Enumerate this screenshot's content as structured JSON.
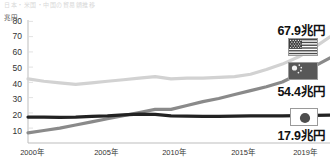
{
  "top_title": "日本・米国・中国の貿易額推移",
  "axis": {
    "unit": "兆円",
    "y_ticks": [
      "80",
      "70",
      "60",
      "50",
      "40",
      "30",
      "20",
      "10"
    ],
    "y_min": 0,
    "y_max": 80,
    "x_ticks": [
      "2000年",
      "2005年",
      "2010年",
      "2015年",
      "2019年"
    ]
  },
  "callouts": {
    "us": "67.9兆円",
    "china": "54.4兆円",
    "japan": "17.9兆円"
  },
  "flags": {
    "us": "us-flag-icon",
    "china": "china-flag-icon",
    "japan": "japan-flag-icon"
  },
  "colors": {
    "us_line": "#d2d2d2",
    "china_line": "#8a8a8a",
    "japan_line": "#222222",
    "axis": "#bdbdbd",
    "text": "#222222"
  },
  "chart_data": {
    "type": "line",
    "title": "日本・米国・中国の貿易額推移",
    "xlabel": "",
    "ylabel": "兆円",
    "ylim": [
      0,
      80
    ],
    "xlim": [
      2000,
      2019
    ],
    "grid": true,
    "legend_position": "right",
    "x": [
      2000,
      2001,
      2002,
      2003,
      2004,
      2005,
      2006,
      2007,
      2008,
      2009,
      2010,
      2011,
      2012,
      2013,
      2014,
      2015,
      2016,
      2017,
      2018,
      2019
    ],
    "series": [
      {
        "name": "米国",
        "label": "67.9兆円",
        "color": "#d2d2d2",
        "values": [
          41.0,
          39.5,
          38.5,
          37.5,
          38.5,
          39.5,
          40.5,
          41.5,
          42.5,
          41.0,
          41.5,
          41.5,
          42.0,
          42.5,
          44.0,
          47.0,
          50.5,
          55.0,
          61.0,
          67.9
        ]
      },
      {
        "name": "中国",
        "label": "54.4兆円",
        "color": "#8a8a8a",
        "values": [
          6.5,
          8.0,
          9.5,
          11.5,
          13.5,
          15.5,
          17.5,
          19.5,
          21.5,
          21.5,
          24.0,
          26.5,
          28.5,
          31.0,
          33.5,
          36.0,
          39.0,
          44.0,
          49.0,
          54.4
        ]
      },
      {
        "name": "日本",
        "label": "17.9兆円",
        "color": "#222222",
        "values": [
          16.6,
          16.5,
          16.4,
          16.5,
          17.0,
          17.3,
          18.0,
          18.5,
          18.3,
          17.4,
          17.2,
          17.0,
          17.0,
          17.2,
          17.3,
          17.3,
          17.4,
          17.5,
          17.7,
          17.9
        ]
      }
    ]
  }
}
